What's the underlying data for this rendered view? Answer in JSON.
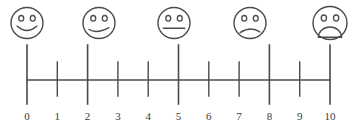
{
  "figure": {
    "name": "faces-pain-rating-scale",
    "width": 356,
    "height": 134,
    "background_color": "#ffffff",
    "stroke_color": "#4a4a4a",
    "label_color": "#3a3a3a"
  },
  "axis": {
    "label": "",
    "min": 0,
    "max": 10,
    "step": 1,
    "line_y": 80,
    "x_start": 27,
    "x_end": 330,
    "tick_labels": [
      "0",
      "1",
      "2",
      "3",
      "4",
      "5",
      "6",
      "7",
      "8",
      "9",
      "10"
    ],
    "label_y": 120,
    "major_positions": [
      0,
      2,
      5,
      8,
      10
    ],
    "major_tick_top": 45,
    "major_tick_bottom": 104,
    "minor_tick_top": 62,
    "minor_tick_bottom": 96
  },
  "faces": [
    {
      "value": 0,
      "name": "face-big-smile",
      "mood": "big smile",
      "cx": 27,
      "cy": 23,
      "rx": 16,
      "ry": 15.5,
      "mouth": "big-smile"
    },
    {
      "value": 2,
      "name": "face-slight-smile",
      "mood": "slight smile",
      "cx": 99,
      "cy": 23,
      "rx": 16,
      "ry": 15.5,
      "mouth": "slight-smile"
    },
    {
      "value": 5,
      "name": "face-neutral",
      "mood": "neutral",
      "cx": 174,
      "cy": 23,
      "rx": 16,
      "ry": 15.5,
      "mouth": "neutral"
    },
    {
      "value": 8,
      "name": "face-slight-frown",
      "mood": "slight frown",
      "cx": 250,
      "cy": 23,
      "rx": 16,
      "ry": 15.5,
      "mouth": "slight-frown"
    },
    {
      "value": 10,
      "name": "face-big-frown",
      "mood": "big frown",
      "cx": 330,
      "cy": 23,
      "rx": 17,
      "ry": 16.5,
      "mouth": "big-frown"
    }
  ],
  "chart_data": {
    "type": "scatter",
    "title": "",
    "subtitle": "",
    "xlabel": "",
    "ylabel": "",
    "xlim": [
      0,
      10
    ],
    "grid": false,
    "legend": "none",
    "categories": [
      "0",
      "1",
      "2",
      "3",
      "4",
      "5",
      "6",
      "7",
      "8",
      "9",
      "10"
    ],
    "x": [
      0,
      1,
      2,
      3,
      4,
      5,
      6,
      7,
      8,
      9,
      10
    ],
    "tick_type": [
      "major",
      "minor",
      "major",
      "minor",
      "minor",
      "major",
      "minor",
      "minor",
      "major",
      "minor",
      "major"
    ],
    "annotations": [
      {
        "x": 0,
        "label": "big smile"
      },
      {
        "x": 2,
        "label": "slight smile"
      },
      {
        "x": 5,
        "label": "neutral"
      },
      {
        "x": 8,
        "label": "slight frown"
      },
      {
        "x": 10,
        "label": "big frown"
      }
    ]
  }
}
